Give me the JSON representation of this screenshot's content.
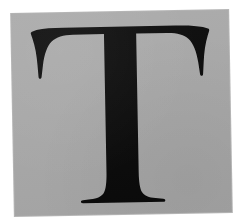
{
  "image": {
    "kind": "letterform-specimen",
    "subject": "capital-letter-T",
    "character": "T",
    "script": "Latin",
    "case": "uppercase",
    "typeface_style": "serif",
    "description": "Black serif capital letter T centered on a gray square card with a white border"
  },
  "canvas": {
    "width_px": 234,
    "height_px": 224,
    "background_color": "#ffffff"
  },
  "card": {
    "name": "gray-panel",
    "left_px": 13,
    "top_px": 12,
    "width_px": 217,
    "height_px": 202,
    "fill_color": "#a9a9a9",
    "edge_color": "#787878",
    "rotation_deg": -1.05
  },
  "glyph": {
    "name": "letter-t-glyph",
    "color": "#0a0a0a",
    "crossbar": {
      "left_px": 38,
      "right_px": 205,
      "top_px": 28,
      "thickness_px": 13
    },
    "stem": {
      "left_px": 105,
      "right_px": 135,
      "width_px": 30,
      "top_px": 28,
      "bottom_px": 203
    },
    "foot_serif": {
      "left_px": 79,
      "right_px": 161,
      "baseline_px": 203
    },
    "left_arm_tip": {
      "x_px": 33,
      "y_px": 73
    },
    "right_arm_tip": {
      "x_px": 209,
      "y_px": 78
    },
    "cap_height_px": 175
  },
  "palette": {
    "ink": "#0a0a0a",
    "card": "#a9a9a9",
    "margin": "#ffffff"
  }
}
